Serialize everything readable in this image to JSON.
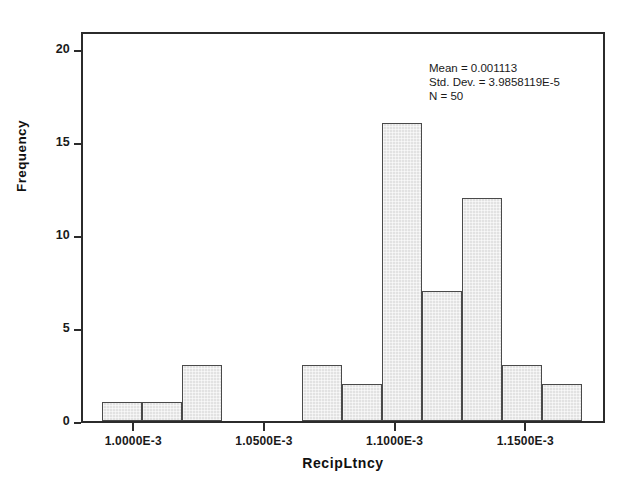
{
  "chart_data": {
    "type": "bar",
    "title": "",
    "subtitle": "",
    "xlabel": "RecipLtncy",
    "ylabel": "Frequency",
    "grid": false,
    "legend_position": "none",
    "xlim": [
      0.00098,
      0.0011805
    ],
    "ylim": [
      0,
      21
    ],
    "bin_width": 5e-06,
    "x_tick_values": [
      0.001,
      0.00105,
      0.0011,
      0.00115
    ],
    "x_tick_labels": [
      "1.0000E-3",
      "1.0500E-3",
      "1.1000E-3",
      "1.1500E-3"
    ],
    "y_tick_values": [
      0,
      5,
      10,
      15,
      20
    ],
    "y_tick_labels": [
      "0",
      "5",
      "10",
      "15",
      "20"
    ],
    "categories": [
      "9.80E-4",
      "9.85E-4",
      "9.90E-4",
      "9.95E-4",
      "1.0000E-3",
      "1.0050E-3",
      "1.0100E-3",
      "1.0150E-3",
      "1.0200E-3",
      "1.0250E-3",
      "1.0300E-3",
      "1.0350E-3",
      "1.0400E-3",
      "1.0450E-3",
      "1.0500E-3",
      "1.0550E-3",
      "1.0600E-3",
      "1.0650E-3",
      "1.0700E-3",
      "1.0750E-3",
      "1.0800E-3",
      "1.0850E-3",
      "1.0900E-3",
      "1.0950E-3",
      "1.1000E-3",
      "1.1050E-3",
      "1.1100E-3",
      "1.1150E-3",
      "1.1200E-3",
      "1.1250E-3",
      "1.1300E-3",
      "1.1350E-3",
      "1.1400E-3",
      "1.1450E-3",
      "1.1500E-3",
      "1.1550E-3",
      "1.1600E-3",
      "1.1650E-3",
      "1.1700E-3",
      "1.1750E-3"
    ],
    "values": [
      1,
      1,
      0,
      3,
      0,
      0,
      0,
      0,
      0,
      0,
      0,
      0,
      0,
      0,
      0,
      0,
      0,
      0,
      0,
      3,
      2,
      0,
      16,
      0,
      7,
      0,
      12,
      0,
      3,
      0,
      2,
      0,
      0,
      0,
      0,
      0,
      0,
      0,
      0,
      0
    ],
    "bars": [
      {
        "left_px": 19,
        "width_px": 40,
        "value": 1
      },
      {
        "left_px": 59,
        "width_px": 40,
        "value": 1
      },
      {
        "left_px": 99,
        "width_px": 40,
        "value": 3
      },
      {
        "left_px": 139,
        "width_px": 40,
        "value": 0
      },
      {
        "left_px": 179,
        "width_px": 40,
        "value": 0
      },
      {
        "left_px": 219,
        "width_px": 40,
        "value": 3
      },
      {
        "left_px": 259,
        "width_px": 40,
        "value": 2
      },
      {
        "left_px": 299,
        "width_px": 40,
        "value": 16
      },
      {
        "left_px": 339,
        "width_px": 40,
        "value": 7
      },
      {
        "left_px": 379,
        "width_px": 40,
        "value": 12
      },
      {
        "left_px": 419,
        "width_px": 40,
        "value": 3
      },
      {
        "left_px": 459,
        "width_px": 40,
        "value": 2
      }
    ],
    "bar_fill_color": "#e2e2e2",
    "bar_border_color": "#4a4a4a",
    "axis_color": "#2b2b2b",
    "background_color": "#ffffff",
    "total_count": 50
  },
  "statistics": {
    "mean_line": "Mean = 0.001113",
    "std_dev_line": "Std. Dev. = 3.9858119E-5",
    "n_line": "N = 50"
  }
}
